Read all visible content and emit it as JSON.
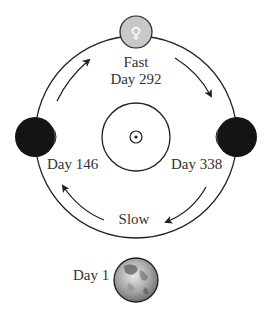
{
  "diagram": {
    "labels": {
      "top_speed": "Fast",
      "top_day": "Day 292",
      "left_day": "Day 146",
      "right_day": "Day 338",
      "bottom_speed": "Slow",
      "earth_day": "Day 1"
    },
    "symbols": {
      "venus": "♀",
      "sun": "sun-symbol"
    },
    "colors": {
      "line": "#222222",
      "venus_lit": "#c8c8c8",
      "venus_dark": "#141414",
      "text": "#333333"
    }
  }
}
